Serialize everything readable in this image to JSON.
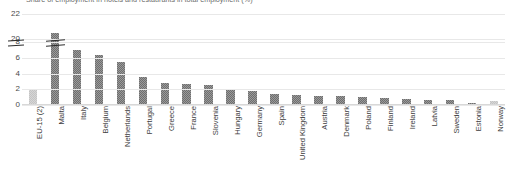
{
  "chart_data": {
    "type": "bar",
    "title": "Share of employment in hotels and restaurants in total employment (%)",
    "xlabel": "",
    "ylabel": "",
    "categories": [
      "EU-15 (2)",
      "Malta",
      "Italy",
      "Belgium",
      "Netherlands",
      "Portugal",
      "Greece",
      "France",
      "Slovenia",
      "Hungary",
      "Germany",
      "Spain",
      "United Kingdom",
      "Austria",
      "Denmark",
      "Poland",
      "Finland",
      "Ireland",
      "Latvia",
      "Sweden",
      "Estonia",
      "Norway"
    ],
    "values": [
      2.1,
      20.5,
      7.0,
      6.3,
      5.5,
      3.6,
      2.8,
      2.7,
      2.6,
      1.9,
      1.8,
      1.4,
      1.3,
      1.2,
      1.1,
      1.0,
      0.9,
      0.8,
      0.7,
      0.6,
      0.25,
      0.5
    ],
    "highlighted": [
      "EU-15 (2)",
      "Norway"
    ],
    "ytick_labels": [
      "0",
      "2",
      "4",
      "6",
      "8",
      "20",
      "22"
    ],
    "ytick_values": [
      0,
      2,
      4,
      6,
      8,
      20,
      22
    ],
    "axis_break": {
      "below": 8,
      "above": 20,
      "present": true
    },
    "ylim": [
      0,
      22
    ],
    "grid": true,
    "legend": "none",
    "colors": {
      "bar": "#6e6e6e",
      "bar_highlight": "#c4c4c4",
      "gridline": "#e8e8e8",
      "text": "#3d3d3d"
    }
  }
}
